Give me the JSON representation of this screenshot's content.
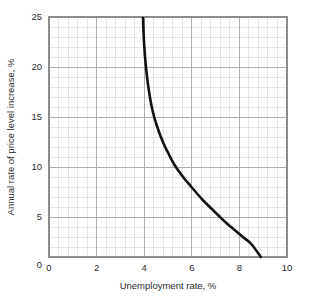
{
  "chart_data": {
    "type": "line",
    "title": "",
    "subtitle": "",
    "xlabel": "Unemployment rate, %",
    "ylabel": "Annual rate of price level increase, %",
    "xlim": [
      0,
      10
    ],
    "ylim": [
      0,
      25
    ],
    "plot_ylim": [
      1,
      25
    ],
    "grid": true,
    "legend": null,
    "x_ticks": [
      0,
      2,
      4,
      6,
      8,
      10
    ],
    "x_tick_labels": [
      "0",
      "2",
      "4",
      "6",
      "8",
      "10"
    ],
    "y_ticks": [
      0,
      5,
      10,
      15,
      20,
      25
    ],
    "y_tick_labels": [
      "0",
      "5",
      "10",
      "15",
      "20",
      "25"
    ],
    "x_minor_step": 0.4,
    "y_minor_step": 1,
    "series": [
      {
        "name": "Phillips curve",
        "color": "#111111",
        "x": [
          3.95,
          3.97,
          4.0,
          4.05,
          4.12,
          4.2,
          4.3,
          4.42,
          4.55,
          4.7,
          4.88,
          5.05,
          5.25,
          5.45,
          5.7,
          5.95,
          6.2,
          6.5,
          6.8,
          7.1,
          7.45,
          7.8,
          8.15,
          8.5,
          8.9
        ],
        "y": [
          24.9,
          23.6,
          22.2,
          20.6,
          19.0,
          17.6,
          16.2,
          15.0,
          14.0,
          13.0,
          12.0,
          11.2,
          10.3,
          9.6,
          8.8,
          8.1,
          7.4,
          6.6,
          5.9,
          5.2,
          4.4,
          3.7,
          3.0,
          2.3,
          1.0
        ]
      }
    ],
    "annotations": []
  },
  "axes": {
    "x_axis_name": "unemployment-rate-axis",
    "y_axis_name": "price-level-increase-axis"
  }
}
